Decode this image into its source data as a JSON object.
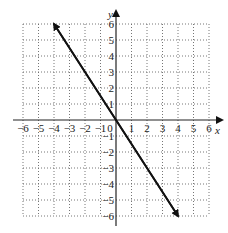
{
  "chart_data": {
    "type": "line",
    "title": "",
    "xlabel": "x",
    "ylabel": "y",
    "xlim": [
      -6,
      6
    ],
    "ylim": [
      -6,
      6
    ],
    "grid": true,
    "grid_style": "dotted",
    "x_ticks": [
      "-6",
      "-5",
      "-4",
      "-3",
      "-2",
      "-1",
      "0",
      "1",
      "2",
      "3",
      "4",
      "5",
      "6"
    ],
    "y_ticks": [
      "6",
      "5",
      "4",
      "3",
      "2",
      "1",
      "-1",
      "-2",
      "-3",
      "-4",
      "-5",
      "-6"
    ],
    "series": [
      {
        "name": "y = -3/2 x",
        "equation": "y = -1.5x",
        "x": [
          -4,
          0,
          4
        ],
        "y": [
          6,
          0,
          -6
        ],
        "arrows_both_ends": true,
        "color": "#111111"
      }
    ]
  },
  "labels": {
    "x_axis": "x",
    "y_axis": "y"
  }
}
